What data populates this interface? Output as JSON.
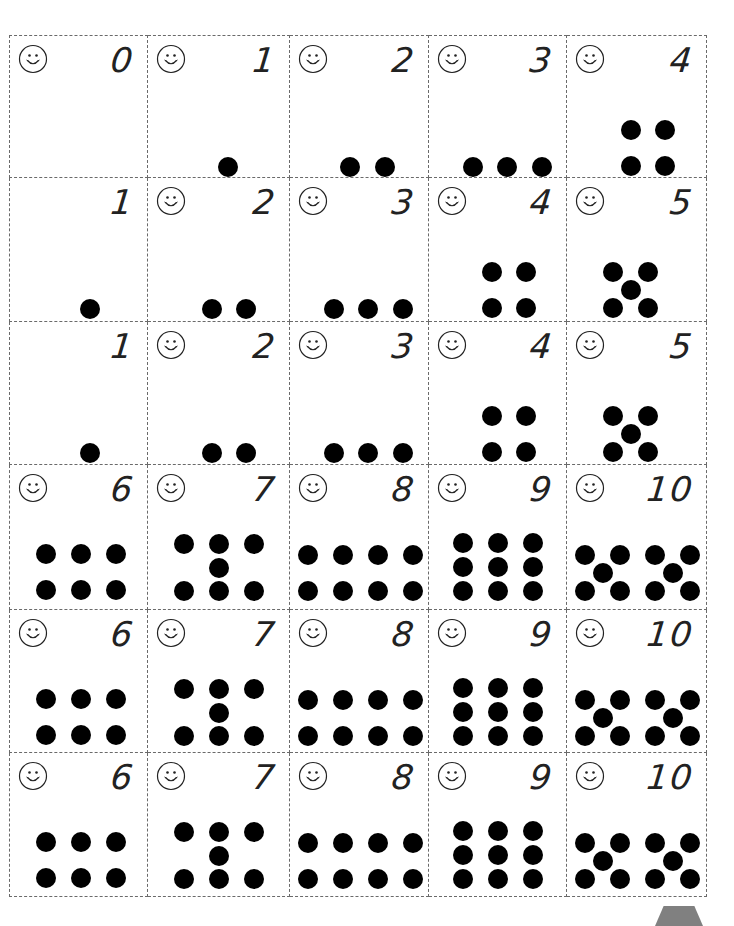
{
  "worksheet": {
    "layout": {
      "col_edges": [
        9,
        148,
        290,
        429,
        567,
        707
      ],
      "row_edges": [
        35,
        178,
        322,
        465,
        610,
        753,
        897
      ]
    },
    "cards": [
      {
        "row": 0,
        "col": 0,
        "numeral": "0",
        "smiley": true,
        "dots": []
      },
      {
        "row": 0,
        "col": 1,
        "numeral": "1",
        "smiley": true,
        "dots": [
          [
            70,
            121
          ]
        ]
      },
      {
        "row": 0,
        "col": 2,
        "numeral": "2",
        "smiley": true,
        "dots": [
          [
            50,
            121
          ],
          [
            85,
            121
          ]
        ]
      },
      {
        "row": 0,
        "col": 3,
        "numeral": "3",
        "smiley": true,
        "dots": [
          [
            34,
            121
          ],
          [
            68,
            121
          ],
          [
            103,
            121
          ]
        ]
      },
      {
        "row": 0,
        "col": 4,
        "numeral": "4",
        "smiley": true,
        "dots": [
          [
            54,
            84
          ],
          [
            88,
            84
          ],
          [
            54,
            120
          ],
          [
            88,
            120
          ]
        ]
      },
      {
        "row": 1,
        "col": 0,
        "numeral": "1",
        "smiley": false,
        "dots": [
          [
            70,
            121
          ]
        ]
      },
      {
        "row": 1,
        "col": 1,
        "numeral": "2",
        "smiley": true,
        "dots": [
          [
            54,
            121
          ],
          [
            88,
            121
          ]
        ]
      },
      {
        "row": 1,
        "col": 2,
        "numeral": "3",
        "smiley": true,
        "dots": [
          [
            34,
            121
          ],
          [
            68,
            121
          ],
          [
            103,
            121
          ]
        ]
      },
      {
        "row": 1,
        "col": 3,
        "numeral": "4",
        "smiley": true,
        "dots": [
          [
            53,
            84
          ],
          [
            87,
            84
          ],
          [
            53,
            120
          ],
          [
            87,
            120
          ]
        ]
      },
      {
        "row": 1,
        "col": 4,
        "numeral": "5",
        "smiley": true,
        "dots": [
          [
            36,
            84
          ],
          [
            71,
            84
          ],
          [
            54,
            102
          ],
          [
            36,
            120
          ],
          [
            71,
            120
          ]
        ]
      },
      {
        "row": 2,
        "col": 0,
        "numeral": "1",
        "smiley": false,
        "dots": [
          [
            70,
            121
          ]
        ]
      },
      {
        "row": 2,
        "col": 1,
        "numeral": "2",
        "smiley": true,
        "dots": [
          [
            54,
            121
          ],
          [
            88,
            121
          ]
        ]
      },
      {
        "row": 2,
        "col": 2,
        "numeral": "3",
        "smiley": true,
        "dots": [
          [
            34,
            121
          ],
          [
            68,
            121
          ],
          [
            103,
            121
          ]
        ]
      },
      {
        "row": 2,
        "col": 3,
        "numeral": "4",
        "smiley": true,
        "dots": [
          [
            53,
            84
          ],
          [
            87,
            84
          ],
          [
            53,
            120
          ],
          [
            87,
            120
          ]
        ]
      },
      {
        "row": 2,
        "col": 4,
        "numeral": "5",
        "smiley": true,
        "dots": [
          [
            36,
            84
          ],
          [
            71,
            84
          ],
          [
            54,
            102
          ],
          [
            36,
            120
          ],
          [
            71,
            120
          ]
        ]
      },
      {
        "row": 3,
        "col": 0,
        "numeral": "6",
        "smiley": true,
        "dots": [
          [
            26,
            79
          ],
          [
            61,
            79
          ],
          [
            96,
            79
          ],
          [
            26,
            115
          ],
          [
            61,
            115
          ],
          [
            96,
            115
          ]
        ]
      },
      {
        "row": 3,
        "col": 1,
        "numeral": "7",
        "smiley": true,
        "dots": [
          [
            26,
            69
          ],
          [
            61,
            69
          ],
          [
            96,
            69
          ],
          [
            61,
            93
          ],
          [
            26,
            116
          ],
          [
            61,
            116
          ],
          [
            96,
            116
          ]
        ]
      },
      {
        "row": 3,
        "col": 2,
        "numeral": "8",
        "smiley": true,
        "dots": [
          [
            8,
            80
          ],
          [
            43,
            80
          ],
          [
            78,
            80
          ],
          [
            113,
            80
          ],
          [
            8,
            116
          ],
          [
            43,
            116
          ],
          [
            78,
            116
          ],
          [
            113,
            116
          ]
        ]
      },
      {
        "row": 3,
        "col": 3,
        "numeral": "9",
        "smiley": true,
        "dots": [
          [
            24,
            68
          ],
          [
            59,
            68
          ],
          [
            94,
            68
          ],
          [
            24,
            92
          ],
          [
            59,
            92
          ],
          [
            94,
            92
          ],
          [
            24,
            116
          ],
          [
            59,
            116
          ],
          [
            94,
            116
          ]
        ]
      },
      {
        "row": 3,
        "col": 4,
        "numeral": "10",
        "smiley": true,
        "dots": [
          [
            8,
            80
          ],
          [
            43,
            80
          ],
          [
            78,
            80
          ],
          [
            113,
            80
          ],
          [
            26,
            98
          ],
          [
            96,
            98
          ],
          [
            8,
            116
          ],
          [
            43,
            116
          ],
          [
            78,
            116
          ],
          [
            113,
            116
          ]
        ]
      },
      {
        "row": 4,
        "col": 0,
        "numeral": "6",
        "smiley": true,
        "dots": [
          [
            26,
            79
          ],
          [
            61,
            79
          ],
          [
            96,
            79
          ],
          [
            26,
            115
          ],
          [
            61,
            115
          ],
          [
            96,
            115
          ]
        ]
      },
      {
        "row": 4,
        "col": 1,
        "numeral": "7",
        "smiley": true,
        "dots": [
          [
            26,
            69
          ],
          [
            61,
            69
          ],
          [
            96,
            69
          ],
          [
            61,
            93
          ],
          [
            26,
            116
          ],
          [
            61,
            116
          ],
          [
            96,
            116
          ]
        ]
      },
      {
        "row": 4,
        "col": 2,
        "numeral": "8",
        "smiley": true,
        "dots": [
          [
            8,
            80
          ],
          [
            43,
            80
          ],
          [
            78,
            80
          ],
          [
            113,
            80
          ],
          [
            8,
            116
          ],
          [
            43,
            116
          ],
          [
            78,
            116
          ],
          [
            113,
            116
          ]
        ]
      },
      {
        "row": 4,
        "col": 3,
        "numeral": "9",
        "smiley": true,
        "dots": [
          [
            24,
            68
          ],
          [
            59,
            68
          ],
          [
            94,
            68
          ],
          [
            24,
            92
          ],
          [
            59,
            92
          ],
          [
            94,
            92
          ],
          [
            24,
            116
          ],
          [
            59,
            116
          ],
          [
            94,
            116
          ]
        ]
      },
      {
        "row": 4,
        "col": 4,
        "numeral": "10",
        "smiley": true,
        "dots": [
          [
            8,
            80
          ],
          [
            43,
            80
          ],
          [
            78,
            80
          ],
          [
            113,
            80
          ],
          [
            26,
            98
          ],
          [
            96,
            98
          ],
          [
            8,
            116
          ],
          [
            43,
            116
          ],
          [
            78,
            116
          ],
          [
            113,
            116
          ]
        ]
      },
      {
        "row": 5,
        "col": 0,
        "numeral": "6",
        "smiley": true,
        "dots": [
          [
            26,
            79
          ],
          [
            61,
            79
          ],
          [
            96,
            79
          ],
          [
            26,
            115
          ],
          [
            61,
            115
          ],
          [
            96,
            115
          ]
        ]
      },
      {
        "row": 5,
        "col": 1,
        "numeral": "7",
        "smiley": true,
        "dots": [
          [
            26,
            69
          ],
          [
            61,
            69
          ],
          [
            96,
            69
          ],
          [
            61,
            93
          ],
          [
            26,
            116
          ],
          [
            61,
            116
          ],
          [
            96,
            116
          ]
        ]
      },
      {
        "row": 5,
        "col": 2,
        "numeral": "8",
        "smiley": true,
        "dots": [
          [
            8,
            80
          ],
          [
            43,
            80
          ],
          [
            78,
            80
          ],
          [
            113,
            80
          ],
          [
            8,
            116
          ],
          [
            43,
            116
          ],
          [
            78,
            116
          ],
          [
            113,
            116
          ]
        ]
      },
      {
        "row": 5,
        "col": 3,
        "numeral": "9",
        "smiley": true,
        "dots": [
          [
            24,
            68
          ],
          [
            59,
            68
          ],
          [
            94,
            68
          ],
          [
            24,
            92
          ],
          [
            59,
            92
          ],
          [
            94,
            92
          ],
          [
            24,
            116
          ],
          [
            59,
            116
          ],
          [
            94,
            116
          ]
        ]
      },
      {
        "row": 5,
        "col": 4,
        "numeral": "10",
        "smiley": true,
        "dots": [
          [
            8,
            80
          ],
          [
            43,
            80
          ],
          [
            78,
            80
          ],
          [
            113,
            80
          ],
          [
            26,
            98
          ],
          [
            96,
            98
          ],
          [
            8,
            116
          ],
          [
            43,
            116
          ],
          [
            78,
            116
          ],
          [
            113,
            116
          ]
        ]
      }
    ],
    "colors": {
      "dot": "#000000",
      "dash_line": "#6a6a6a",
      "corner_tab": "#808080"
    }
  }
}
